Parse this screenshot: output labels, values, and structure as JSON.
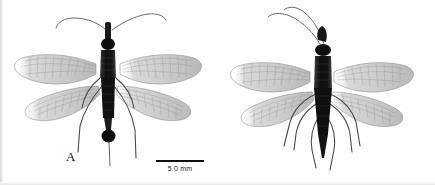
{
  "figure": {
    "type": "scientific-specimen-plate",
    "background_color": "#ffffff",
    "ink_color": "#111111",
    "panel_count": 2
  },
  "panels": [
    {
      "id": "A",
      "label": "A",
      "label_x": 66,
      "label_y": 149,
      "specimen": {
        "name": "winged-insect-dorsal-view",
        "body_color": "#141414",
        "wing_color": "#8c8c8c",
        "abdomen_tip": "bulbous-club",
        "wing_count": 4,
        "antenna_count": 2,
        "leg_count": 4,
        "center_x": 108,
        "body_top_y": 22,
        "body_bottom_y": 142
      },
      "scale_bar": {
        "label": "5.0 mm",
        "length_px": 48,
        "x": 156,
        "y": 160,
        "color": "#111111"
      }
    },
    {
      "id": "B",
      "label": "B",
      "label_x": 286,
      "label_y": 149,
      "specimen": {
        "name": "winged-insect-dorsal-view",
        "body_color": "#141414",
        "wing_color": "#8c8c8c",
        "abdomen_tip": "tapered-point",
        "wing_count": 4,
        "antenna_count": 2,
        "leg_count": 6,
        "center_x": 320,
        "body_top_y": 38,
        "body_bottom_y": 150
      },
      "scale_bar": {
        "label": "5.0 mm",
        "length_px": 48,
        "x": 378,
        "y": 160,
        "color": "#111111"
      }
    }
  ]
}
